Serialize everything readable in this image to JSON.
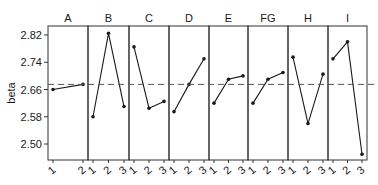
{
  "chart_data": {
    "type": "line",
    "title": "",
    "xlabel": "",
    "ylabel": "beta",
    "ylim": [
      2.455,
      2.845
    ],
    "yticks": [
      2.5,
      2.58,
      2.66,
      2.74,
      2.82
    ],
    "ytick_labels": [
      "2.50",
      "2.58",
      "2.66",
      "2.74",
      "2.82"
    ],
    "grid": false,
    "legend": "none",
    "reference_line": {
      "value": 2.675,
      "style": "dashed"
    },
    "panels": [
      {
        "name": "A",
        "levels": [
          "1",
          "2"
        ],
        "values": [
          2.66,
          2.675
        ]
      },
      {
        "name": "B",
        "levels": [
          "1",
          "2",
          "3"
        ],
        "values": [
          2.58,
          2.825,
          2.61
        ]
      },
      {
        "name": "C",
        "levels": [
          "1",
          "2",
          "3"
        ],
        "values": [
          2.785,
          2.605,
          2.625
        ]
      },
      {
        "name": "D",
        "levels": [
          "1",
          "2",
          "3"
        ],
        "values": [
          2.595,
          2.675,
          2.75
        ]
      },
      {
        "name": "E",
        "levels": [
          "1",
          "2",
          "3"
        ],
        "values": [
          2.62,
          2.69,
          2.7
        ]
      },
      {
        "name": "FG",
        "levels": [
          "1",
          "2",
          "3"
        ],
        "values": [
          2.62,
          2.69,
          2.71
        ]
      },
      {
        "name": "H",
        "levels": [
          "1",
          "2",
          "3"
        ],
        "values": [
          2.755,
          2.56,
          2.705
        ]
      },
      {
        "name": "I",
        "levels": [
          "1",
          "2",
          "3"
        ],
        "values": [
          2.75,
          2.8,
          2.47
        ]
      }
    ]
  },
  "colors": {
    "line": "#1a1a1a",
    "border": "#333333",
    "reference": "#555555"
  }
}
